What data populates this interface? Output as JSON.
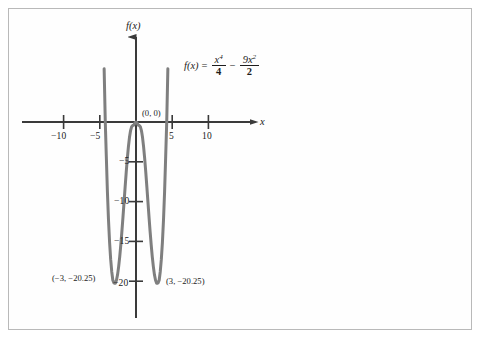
{
  "chart_data": {
    "type": "line",
    "title": "",
    "subtitle": "",
    "xlabel": "x",
    "ylabel": "f(x)",
    "xlim": [
      -15.8,
      16.5
    ],
    "ylim": [
      -25.0,
      8.2
    ],
    "grid": false,
    "legend": null,
    "function_expression": "f(x) = x^4/4 - 9x^2/2",
    "equation": {
      "lhs": "f(x)",
      "equals": "=",
      "term1_numerator": "x",
      "term1_numerator_exponent": "4",
      "term1_denominator": "4",
      "operator": "−",
      "term2_numerator": "9x",
      "term2_numerator_exponent": "2",
      "term2_denominator": "2"
    },
    "x_ticks": [
      {
        "value": -10,
        "label": "−10"
      },
      {
        "value": -5,
        "label": "−5"
      },
      {
        "value": 5,
        "label": "5"
      },
      {
        "value": 10,
        "label": "10"
      }
    ],
    "y_ticks": [
      {
        "value": -5,
        "label": "−5"
      },
      {
        "value": -10,
        "label": "−10"
      },
      {
        "value": -15,
        "label": "−15"
      },
      {
        "value": -20,
        "label": "−20"
      }
    ],
    "annotations": [
      {
        "name": "origin-label",
        "text": "(0, 0)",
        "x": 0,
        "y": 0
      },
      {
        "name": "left-minimum-label",
        "text": "(−3, −20.25)",
        "x": -3,
        "y": -20.25
      },
      {
        "name": "right-minimum-label",
        "text": "(3, −20.25)",
        "x": 3,
        "y": -20.25
      }
    ],
    "key_points": [
      {
        "label": "local maximum",
        "x": 0,
        "y": 0
      },
      {
        "label": "local minimum",
        "x": -3,
        "y": -20.25
      },
      {
        "label": "local minimum",
        "x": 3,
        "y": -20.25
      },
      {
        "label": "x-intercept",
        "x": -4.2426,
        "y": 0
      },
      {
        "label": "x-intercept",
        "x": 4.2426,
        "y": 0
      }
    ],
    "series": [
      {
        "name": "f(x) = x^4/4 - 9x^2/2",
        "x": [
          -4.85,
          -4.7,
          -4.55,
          -4.4,
          -4.2426,
          -4.1,
          -3.95,
          -3.8,
          -3.65,
          -3.5,
          -3.35,
          -3.2,
          -3.05,
          -3.0,
          -2.85,
          -2.7,
          -2.55,
          -2.4,
          -2.25,
          -2.1,
          -1.95,
          -1.8,
          -1.65,
          -1.5,
          -1.35,
          -1.2,
          -1.05,
          -0.9,
          -0.75,
          -0.6,
          -0.45,
          -0.3,
          -0.15,
          0,
          0.15,
          0.3,
          0.45,
          0.6,
          0.75,
          0.9,
          1.05,
          1.2,
          1.35,
          1.5,
          1.65,
          1.8,
          1.95,
          2.1,
          2.25,
          2.4,
          2.55,
          2.7,
          2.85,
          3.0,
          3.05,
          3.2,
          3.35,
          3.5,
          3.65,
          3.8,
          3.95,
          4.1,
          4.2426,
          4.4,
          4.55,
          4.7,
          4.85
        ],
        "y": [
          32.45,
          22.75,
          14.18,
          6.68,
          0.0,
          -4.34,
          -8.73,
          -12.28,
          -15.08,
          -17.23,
          -18.81,
          -19.88,
          -20.21,
          -20.25,
          -20.25,
          -19.89,
          -19.2,
          -18.2,
          -16.94,
          -15.45,
          -13.77,
          -11.96,
          -10.06,
          -8.16,
          -6.3,
          -4.6,
          -3.12,
          -1.93,
          -1.08,
          -0.59,
          -0.44,
          -0.4,
          -0.1,
          0.0,
          -0.1,
          -0.4,
          -0.44,
          -0.59,
          -1.08,
          -1.93,
          -3.12,
          -4.6,
          -6.3,
          -8.16,
          -10.06,
          -11.96,
          -13.77,
          -15.45,
          -16.94,
          -18.2,
          -19.2,
          -19.89,
          -20.25,
          -20.25,
          -20.21,
          -19.88,
          -18.81,
          -17.23,
          -15.08,
          -12.28,
          -8.73,
          -4.34,
          0.0,
          6.68,
          14.18,
          22.75,
          32.45
        ],
        "color": "#7f7f7f",
        "linewidth": 3
      }
    ],
    "colors": {
      "curve": "#7f7f7f",
      "axis": "#3a3a3a",
      "text": "#222222",
      "frame": "#b9b9b9",
      "background": "#ffffff"
    }
  }
}
